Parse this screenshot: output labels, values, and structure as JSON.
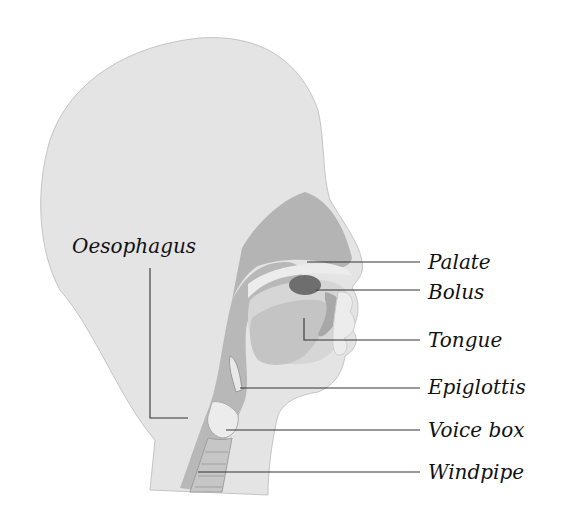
{
  "diagram": {
    "colors": {
      "background": "#ffffff",
      "head_skin": "#e4e4e4",
      "tissue": "#b8b8b8",
      "tissue_dark": "#a9a9a9",
      "tongue": "#c8c8c8",
      "mouth_cavity": "#d6d6d6",
      "bolus": "#6e6e6e",
      "light_parts": "#ececec",
      "leader_line": "#333333",
      "label_text": "#111111"
    },
    "labels": [
      {
        "id": "oesophagus",
        "text": "Oesophagus",
        "side": "left"
      },
      {
        "id": "palate",
        "text": "Palate",
        "side": "right"
      },
      {
        "id": "bolus",
        "text": "Bolus",
        "side": "right"
      },
      {
        "id": "tongue",
        "text": "Tongue",
        "side": "right"
      },
      {
        "id": "epiglottis",
        "text": "Epiglottis",
        "side": "right"
      },
      {
        "id": "voice-box",
        "text": "Voice box",
        "side": "right"
      },
      {
        "id": "windpipe",
        "text": "Windpipe",
        "side": "right"
      }
    ]
  }
}
